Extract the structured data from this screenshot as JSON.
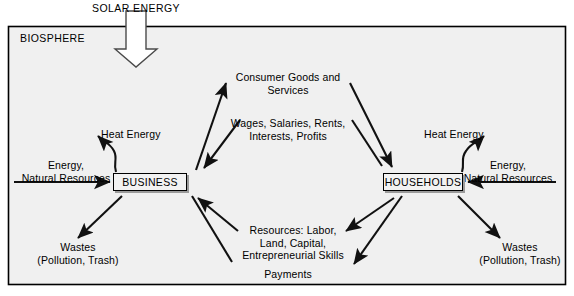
{
  "diagram": {
    "solar_energy_label": "SOLAR ENERGY",
    "biosphere_label": "BIOSPHERE",
    "sectors": [
      {
        "id": "business",
        "label": "BUSINESS"
      },
      {
        "id": "households",
        "label": "HOUSEHOLDS"
      }
    ],
    "flow_labels": {
      "consumer_goods": "Consumer Goods and\nServices",
      "wages": "Wages, Salaries, Rents,\nInterests, Profits",
      "resources": "Resources: Labor,\nLand, Capital,\nEntrepreneurial Skills",
      "payments": "Payments",
      "heat_energy_left": "Heat Energy",
      "heat_energy_right": "Heat Energy",
      "energy_inputs_left": "Energy,\nNatural Resources",
      "energy_inputs_right": "Energy,\nNatural Resources",
      "wastes_left": "Wastes\n(Pollution, Trash)",
      "wastes_right": "Wastes\n(Pollution, Trash)"
    },
    "colors": {
      "background": "#ffffff",
      "biosphere_fill": "#f0f0f0",
      "stroke": "#000000",
      "box_fill": "#f2f2f2",
      "box_shadow": "#9b9b9b",
      "arrow_fill": "#ffffff"
    }
  }
}
